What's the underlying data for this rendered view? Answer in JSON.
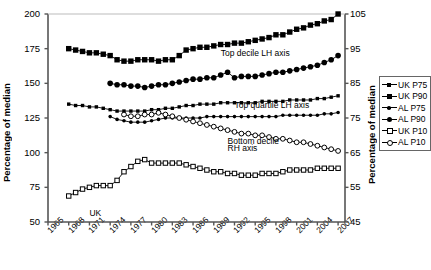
{
  "chart_data": {
    "type": "line",
    "title": "",
    "xlabel": "",
    "ylabel": "Percentage of median",
    "ylabel_right": "Percentage of median",
    "ylim": [
      50,
      200
    ],
    "ylim_right": [
      45,
      105
    ],
    "yticks": [
      50,
      75,
      100,
      125,
      150,
      175,
      200
    ],
    "yticks_right": [
      45,
      55,
      65,
      75,
      85,
      95,
      105
    ],
    "xlim": [
      1965,
      2008
    ],
    "xticks": [
      1965,
      1968,
      1971,
      1974,
      1977,
      1980,
      1983,
      1986,
      1989,
      1992,
      1995,
      1998,
      2001,
      2004,
      2007
    ],
    "grid": false,
    "legend_position": "right-outside",
    "annotations": [
      {
        "text": "Top decile LH axis",
        "x": 1990,
        "y": 171
      },
      {
        "text": "Top quartile LH axis",
        "x": 1992,
        "y": 134
      },
      {
        "text": "Bottom decile",
        "x": 1991,
        "y": 108
      },
      {
        "text": "RH axis",
        "x": 1991,
        "y": 103
      },
      {
        "text": "UK",
        "x": 1971,
        "y": 56
      }
    ],
    "series": [
      {
        "name": "UK P90",
        "axis": "left",
        "marker": "filled-square",
        "marker_size": "large",
        "x": [
          1968,
          1969,
          1970,
          1971,
          1972,
          1973,
          1974,
          1975,
          1976,
          1977,
          1978,
          1979,
          1980,
          1981,
          1982,
          1983,
          1984,
          1985,
          1986,
          1987,
          1988,
          1989,
          1990,
          1991,
          1992,
          1993,
          1994,
          1995,
          1996,
          1997,
          1998,
          1999,
          2000,
          2001,
          2002,
          2003,
          2004,
          2005,
          2006,
          2007
        ],
        "values": [
          175,
          174,
          173,
          172,
          172,
          171,
          170,
          167,
          166,
          166,
          167,
          167,
          167,
          166,
          167,
          167,
          170,
          174,
          175,
          176,
          176,
          177,
          178,
          178,
          179,
          179,
          180,
          181,
          182,
          183,
          185,
          185,
          187,
          189,
          190,
          192,
          193,
          195,
          196,
          200
        ]
      },
      {
        "name": "AL P90",
        "axis": "left",
        "marker": "filled-circle",
        "marker_size": "large",
        "x": [
          1974,
          1975,
          1976,
          1977,
          1978,
          1979,
          1980,
          1981,
          1982,
          1983,
          1984,
          1985,
          1986,
          1987,
          1988,
          1989,
          1990,
          1991,
          1992,
          1993,
          1994,
          1995,
          1996,
          1997,
          1998,
          1999,
          2000,
          2001,
          2002,
          2003,
          2004,
          2005,
          2006,
          2007
        ],
        "values": [
          150,
          149,
          149,
          148,
          148,
          147,
          148,
          149,
          149,
          150,
          151,
          152,
          153,
          153,
          154,
          154,
          156,
          158,
          154,
          155,
          155,
          155,
          156,
          157,
          158,
          158,
          159,
          160,
          161,
          162,
          163,
          165,
          167,
          170
        ]
      },
      {
        "name": "UK P75",
        "axis": "left",
        "marker": "filled-square",
        "marker_size": "small",
        "x": [
          1968,
          1969,
          1970,
          1971,
          1972,
          1973,
          1974,
          1975,
          1976,
          1977,
          1978,
          1979,
          1980,
          1981,
          1982,
          1983,
          1984,
          1985,
          1986,
          1987,
          1988,
          1989,
          1990,
          1991,
          1992,
          1993,
          1994,
          1995,
          1996,
          1997,
          1998,
          1999,
          2000,
          2001,
          2002,
          2003,
          2004,
          2005,
          2006,
          2007
        ],
        "values": [
          135,
          134,
          134,
          133,
          133,
          132,
          131,
          130,
          130,
          130,
          130,
          130,
          131,
          131,
          132,
          132,
          133,
          134,
          134,
          135,
          135,
          135,
          136,
          136,
          136,
          136,
          136,
          136,
          137,
          137,
          137,
          137,
          138,
          138,
          138,
          138,
          139,
          139,
          140,
          141
        ]
      },
      {
        "name": "AL P75",
        "axis": "left",
        "marker": "filled-circle",
        "marker_size": "small",
        "x": [
          1974,
          1975,
          1976,
          1977,
          1978,
          1979,
          1980,
          1981,
          1982,
          1983,
          1984,
          1985,
          1986,
          1987,
          1988,
          1989,
          1990,
          1991,
          1992,
          1993,
          1994,
          1995,
          1996,
          1997,
          1998,
          1999,
          2000,
          2001,
          2002,
          2003,
          2004,
          2005,
          2006,
          2007
        ],
        "values": [
          126,
          124,
          123,
          122,
          122,
          122,
          123,
          124,
          125,
          125,
          125,
          125,
          125,
          125,
          126,
          126,
          126,
          126,
          126,
          126,
          126,
          126,
          126,
          126,
          126,
          127,
          127,
          127,
          127,
          127,
          127,
          128,
          128,
          129
        ]
      },
      {
        "name": "UK P10",
        "axis": "right",
        "marker": "open-square",
        "marker_size": "small",
        "x": [
          1968,
          1969,
          1970,
          1971,
          1972,
          1973,
          1974,
          1975,
          1976,
          1977,
          1978,
          1979,
          1980,
          1981,
          1982,
          1983,
          1984,
          1985,
          1986,
          1987,
          1988,
          1989,
          1990,
          1991,
          1992,
          1993,
          1994,
          1995,
          1996,
          1997,
          1998,
          1999,
          2000,
          2001,
          2002,
          2003,
          2004,
          2005,
          2006,
          2007
        ],
        "values": [
          52.5,
          53.5,
          54.5,
          55,
          55.5,
          55.5,
          55.5,
          57,
          59.5,
          61,
          62.5,
          63,
          62,
          62,
          62,
          62,
          62,
          61.5,
          61,
          60.5,
          60,
          59.5,
          59.5,
          59,
          59,
          58.5,
          58.5,
          58.5,
          59,
          59,
          59,
          59.5,
          60,
          60,
          60,
          60,
          60.5,
          60.5,
          60.5,
          60.5
        ]
      },
      {
        "name": "AL P10",
        "axis": "right",
        "marker": "open-circle",
        "marker_size": "small",
        "x": [
          1976,
          1977,
          1978,
          1979,
          1980,
          1981,
          1982,
          1983,
          1984,
          1985,
          1986,
          1987,
          1988,
          1989,
          1990,
          1991,
          1992,
          1993,
          1994,
          1995,
          1996,
          1997,
          1998,
          1999,
          2000,
          2001,
          2002,
          2003,
          2004,
          2005,
          2006,
          2007
        ],
        "values": [
          76,
          75.5,
          75.5,
          76,
          76,
          76.5,
          76,
          75.5,
          75,
          74.5,
          74,
          73.5,
          73,
          72.5,
          72,
          71.5,
          71,
          70.5,
          70.5,
          70,
          70,
          69.5,
          69,
          69,
          68.5,
          68,
          68,
          67.5,
          67,
          66.5,
          66,
          65.5
        ]
      }
    ]
  },
  "legend": {
    "items": [
      {
        "label": "UK P75",
        "marker": "filled-square-small"
      },
      {
        "label": "UK P90",
        "marker": "filled-square-large"
      },
      {
        "label": "AL P75",
        "marker": "filled-circle-small"
      },
      {
        "label": "AL P90",
        "marker": "filled-circle-large"
      },
      {
        "label": "UK P10",
        "marker": "open-square"
      },
      {
        "label": "AL P10",
        "marker": "open-circle"
      }
    ]
  },
  "colors": {
    "series": "#000000",
    "axis": "#555555",
    "background": "#ffffff"
  }
}
